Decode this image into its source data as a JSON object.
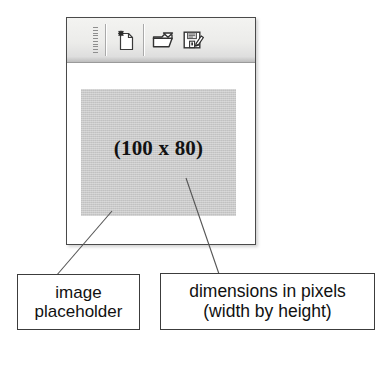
{
  "window": {
    "toolbar": {
      "grip_name": "drag-grip",
      "buttons": [
        {
          "id": "new",
          "label": "New",
          "icon": "new-document-icon"
        },
        {
          "id": "open",
          "label": "Open",
          "icon": "open-folder-icon"
        },
        {
          "id": "save",
          "label": "Save",
          "icon": "save-floppy-icon"
        }
      ]
    },
    "canvas": {
      "placeholder": {
        "label": "(100 x 80)",
        "width_px": 100,
        "height_px": 80,
        "fill_color": "#c9c9c9"
      }
    }
  },
  "annotations": [
    {
      "id": "image-placeholder",
      "line1": "image",
      "line2": "placeholder"
    },
    {
      "id": "dimensions-in-pixels",
      "line1": "dimensions in pixels",
      "line2": "(width by height)"
    }
  ],
  "colors": {
    "frame_border": "#4a4a4a",
    "toolbar_bg": "#ececea",
    "placeholder_fill": "#c9c9c9",
    "annotation_border": "#3c3c3c",
    "leader_line": "#555555"
  }
}
